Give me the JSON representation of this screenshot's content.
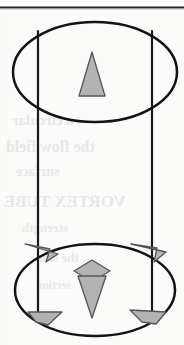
{
  "figure": {
    "caption_visible": false,
    "background_color": "#fbfbfa",
    "ink_color": "#1a1a1a",
    "arrow_fill": "#b3b3b3",
    "arrow_stroke": "#4d4d4d",
    "page_rule": {
      "name": "top-horizontal-rule",
      "y": 7,
      "x1": 0,
      "x2": 184,
      "thickness": 2,
      "color": "#262626"
    },
    "top_ellipse": {
      "cx": 95,
      "cy": 72,
      "rx": 82,
      "ry": 50,
      "stroke_width": 2.4
    },
    "bottom_ellipse": {
      "cx": 95,
      "cy": 290,
      "rx": 80,
      "ry": 46,
      "stroke_width": 2.4
    },
    "left_wall_x": 38,
    "right_wall_x": 152,
    "wall_top_y": 31,
    "wall_bottom_y": 322,
    "wall_stroke_width": 2.2,
    "shapes": [
      {
        "name": "top-center-up-triangle",
        "kind": "triangle",
        "direction": "up",
        "cx": 92,
        "cy": 74,
        "width": 26,
        "height": 44
      },
      {
        "name": "bottom-center-down-arrow",
        "kind": "arrow",
        "direction": "down",
        "cx": 92,
        "cy": 292,
        "width": 28,
        "height": 50
      },
      {
        "name": "bottom-center-diamond",
        "kind": "diamond",
        "cx": 92,
        "cy": 271,
        "width": 34,
        "height": 22
      },
      {
        "name": "upper-left-arrowhead",
        "kind": "arrowhead",
        "direction": "down-left",
        "cx": 42,
        "cy": 251
      },
      {
        "name": "upper-right-arrowhead",
        "kind": "arrowhead",
        "direction": "down-left",
        "cx": 150,
        "cy": 251
      },
      {
        "name": "lower-left-arrowhead",
        "kind": "arrowhead",
        "direction": "down-right",
        "cx": 44,
        "cy": 318
      },
      {
        "name": "lower-right-arrowhead",
        "kind": "arrowhead",
        "direction": "down-left",
        "cx": 150,
        "cy": 318
      }
    ],
    "ghost_text": [
      {
        "text": "a circular",
        "x": 12,
        "y": 120,
        "size": 15
      },
      {
        "text": "the flow field",
        "x": 6,
        "y": 146,
        "size": 16
      },
      {
        "text": "surface",
        "x": 16,
        "y": 172,
        "size": 14
      },
      {
        "text": "VORTEX TUBE",
        "x": 4,
        "y": 200,
        "size": 17
      },
      {
        "text": "strength",
        "x": 22,
        "y": 228,
        "size": 13
      },
      {
        "text": "the same",
        "x": 30,
        "y": 258,
        "size": 13
      },
      {
        "text": "section",
        "x": 36,
        "y": 286,
        "size": 12
      }
    ]
  }
}
